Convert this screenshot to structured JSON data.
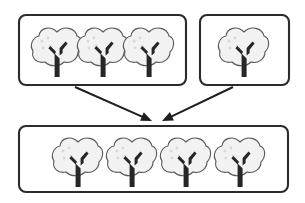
{
  "diagram": {
    "type": "part-part-whole",
    "background_color": "#ffffff",
    "box_border_color": "#2b2b2b",
    "canopy_fill": "#f2f2f2",
    "canopy_outline": "#5a5a5a",
    "trunk_color": "#262626",
    "arrow_color": "#1f1f1f",
    "groups": [
      {
        "id": "group-a",
        "role": "addend",
        "tree_count": 3,
        "box": {
          "x": 19,
          "y": 15,
          "width": 167,
          "height": 70,
          "radius": 7
        },
        "trees": [
          {
            "cx": 57,
            "cy": 50
          },
          {
            "cx": 103,
            "cy": 50
          },
          {
            "cx": 149,
            "cy": 50
          }
        ]
      },
      {
        "id": "group-b",
        "role": "addend",
        "tree_count": 1,
        "box": {
          "x": 200,
          "y": 15,
          "width": 89,
          "height": 70,
          "radius": 7
        },
        "trees": [
          {
            "cx": 244,
            "cy": 50
          }
        ]
      },
      {
        "id": "group-total",
        "role": "sum",
        "tree_count": 4,
        "box": {
          "x": 19,
          "y": 126,
          "width": 269,
          "height": 66,
          "radius": 7
        },
        "trees": [
          {
            "cx": 78,
            "cy": 160
          },
          {
            "cx": 132,
            "cy": 160
          },
          {
            "cx": 186,
            "cy": 160
          },
          {
            "cx": 240,
            "cy": 160
          }
        ]
      }
    ],
    "arrows": [
      {
        "id": "arrow-left",
        "from_group": "group-a",
        "to_group": "group-total",
        "x1": 75,
        "y1": 87,
        "x2": 152,
        "y2": 121,
        "head_angle_deg": 24
      },
      {
        "id": "arrow-right",
        "from_group": "group-b",
        "to_group": "group-total",
        "x1": 233,
        "y1": 87,
        "x2": 162,
        "y2": 121,
        "head_angle_deg": 205
      }
    ],
    "tree_glyph": {
      "canopy_rx": 21,
      "canopy_ry": 17,
      "trunk_width": 5,
      "trunk_height": 27,
      "branch_count": 2,
      "speck_count": 4
    }
  }
}
